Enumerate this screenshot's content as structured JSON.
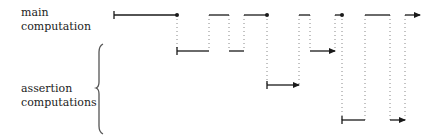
{
  "labels": {
    "main": [
      "main",
      "computation"
    ],
    "assertion": [
      "assertion",
      "computations"
    ]
  },
  "colors": {
    "line": "#1a1a1a",
    "dotted": "#888888",
    "brace": "#555555",
    "text": "#222222"
  },
  "levels": {
    "main_y": 15,
    "assert1_y": 51,
    "assert2_y": 85,
    "assert3_y": 120
  },
  "segments": {
    "main": [
      {
        "x1": 114,
        "x2": 177,
        "start": "tick",
        "end": "dot"
      },
      {
        "x1": 209,
        "x2": 229,
        "start": "none",
        "end": "none"
      },
      {
        "x1": 244,
        "x2": 267,
        "start": "none",
        "end": "dot"
      },
      {
        "x1": 299,
        "x2": 310,
        "start": "none",
        "end": "none"
      },
      {
        "x1": 335,
        "x2": 342,
        "start": "none",
        "end": "dot"
      },
      {
        "x1": 365,
        "x2": 390,
        "start": "none",
        "end": "none"
      },
      {
        "x1": 405,
        "x2": 420,
        "start": "none",
        "end": "arrow"
      }
    ],
    "assertion": [
      {
        "level": "assert1_y",
        "x1": 177,
        "x2": 209,
        "start": "tick",
        "end": "none"
      },
      {
        "level": "assert1_y",
        "x1": 229,
        "x2": 244,
        "start": "none",
        "end": "none"
      },
      {
        "level": "assert2_y",
        "x1": 267,
        "x2": 299,
        "start": "tick",
        "end": "arrow"
      },
      {
        "level": "assert1_y",
        "x1": 310,
        "x2": 335,
        "start": "none",
        "end": "arrow"
      },
      {
        "level": "assert3_y",
        "x1": 342,
        "x2": 365,
        "start": "tick",
        "end": "none"
      },
      {
        "level": "assert3_y",
        "x1": 390,
        "x2": 405,
        "start": "none",
        "end": "arrow"
      }
    ],
    "dotted": [
      {
        "x": 177,
        "y1": 15,
        "y2": 51
      },
      {
        "x": 209,
        "y1": 15,
        "y2": 51
      },
      {
        "x": 229,
        "y1": 15,
        "y2": 51
      },
      {
        "x": 244,
        "y1": 15,
        "y2": 51
      },
      {
        "x": 267,
        "y1": 15,
        "y2": 85
      },
      {
        "x": 299,
        "y1": 15,
        "y2": 85
      },
      {
        "x": 310,
        "y1": 15,
        "y2": 51
      },
      {
        "x": 335,
        "y1": 15,
        "y2": 51
      },
      {
        "x": 342,
        "y1": 15,
        "y2": 120
      },
      {
        "x": 365,
        "y1": 15,
        "y2": 120
      },
      {
        "x": 390,
        "y1": 15,
        "y2": 120
      },
      {
        "x": 405,
        "y1": 15,
        "y2": 120
      }
    ]
  }
}
